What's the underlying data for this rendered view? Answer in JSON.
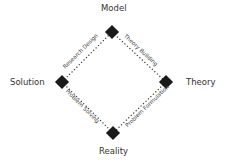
{
  "nodes": {
    "model": {
      "label": "Model"
    },
    "theory": {
      "label": "Theory"
    },
    "reality": {
      "label": "Reality"
    },
    "solution": {
      "label": "Solution"
    }
  },
  "edges": {
    "model_theory": {
      "label": "Theory Building"
    },
    "theory_reality": {
      "label": "Problem Formulation"
    },
    "reality_solution": {
      "label": "Problem Solving"
    },
    "solution_model": {
      "label": "Research Design"
    }
  },
  "colors": {
    "marker": "#1a1a1a",
    "line": "#333333",
    "text": "#333333"
  }
}
